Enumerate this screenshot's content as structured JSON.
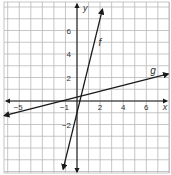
{
  "chart_data": {
    "type": "line",
    "title": "",
    "xlabel": "x",
    "ylabel": "y",
    "xlim": [
      -6.7,
      8.2
    ],
    "ylim": [
      -6.4,
      8.6
    ],
    "grid": true,
    "x_tick_labels": [
      "-5",
      "-1",
      "2",
      "4",
      "6"
    ],
    "x_ticks": [
      -5,
      -1,
      2,
      4,
      6
    ],
    "y_tick_labels": [
      "6",
      "4",
      "2",
      "-2"
    ],
    "y_ticks": [
      6,
      4,
      2,
      -2
    ],
    "series": [
      {
        "name": "f",
        "label": "f",
        "slope": 4,
        "intercept": -1,
        "x": [
          -1.2,
          2.2
        ],
        "y": [
          -5.8,
          7.8
        ],
        "arrows": "both"
      },
      {
        "name": "g",
        "label": "g",
        "slope": 0.25,
        "intercept": 0.33,
        "x": [
          -6.3,
          7.9
        ],
        "y": [
          -1.25,
          2.3
        ],
        "arrows": "both"
      }
    ],
    "color": "#1a1a1a",
    "grid_color": "#b8b8b8"
  }
}
